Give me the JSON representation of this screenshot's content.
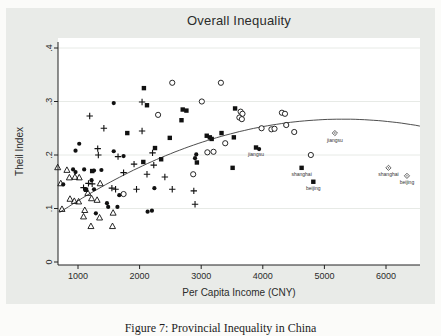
{
  "title": "Overall Inequality",
  "caption": "Figure 7: Provincial Inequality in China",
  "colors": {
    "marker": "#111111",
    "curve": "#3a3a3a",
    "figure_bg": "#e9ebe8",
    "plot_bg": "#ffffff",
    "grid": "#e7eae6",
    "axis": "#222222",
    "text": "#2b2b2b"
  },
  "axes": {
    "x": {
      "label": "Per Capita Income (CNY)",
      "ticks": [
        {
          "v": 1000,
          "label": "1000"
        },
        {
          "v": 2000,
          "label": "2000"
        },
        {
          "v": 3000,
          "label": "3000"
        },
        {
          "v": 4000,
          "label": "4000"
        },
        {
          "v": 5000,
          "label": "5000"
        },
        {
          "v": 6000,
          "label": "6000"
        }
      ]
    },
    "y": {
      "label": "Theil Index",
      "ticks": [
        {
          "v": 0,
          "label": "0"
        },
        {
          "v": 0.1,
          "label": ".1"
        },
        {
          "v": 0.2,
          "label": ".2"
        },
        {
          "v": 0.3,
          "label": ".3"
        },
        {
          "v": 0.4,
          "label": ".4"
        }
      ]
    }
  },
  "chart_data": {
    "type": "scatter",
    "title": "Overall Inequality",
    "xlabel": "Per Capita Income (CNY)",
    "ylabel": "Theil Index",
    "xlim": [
      600,
      6800
    ],
    "ylim": [
      0,
      0.42
    ],
    "grid": "horizontal-light",
    "legend": "none",
    "series": [
      {
        "name": "open-circle-markers",
        "marker": "circle-open",
        "points": [
          [
            2530,
            0.335
          ],
          [
            3320,
            0.335
          ],
          [
            2300,
            0.275
          ],
          [
            3010,
            0.3
          ],
          [
            3640,
            0.281
          ],
          [
            3670,
            0.277
          ],
          [
            3620,
            0.27
          ],
          [
            3660,
            0.267
          ],
          [
            4310,
            0.279
          ],
          [
            4360,
            0.277
          ],
          [
            4380,
            0.256
          ],
          [
            4140,
            0.248
          ],
          [
            4190,
            0.249
          ],
          [
            3980,
            0.25
          ],
          [
            4510,
            0.243
          ],
          [
            4780,
            0.2
          ],
          [
            3390,
            0.222
          ],
          [
            3100,
            0.205
          ],
          [
            3200,
            0.206
          ],
          [
            2870,
            0.164
          ],
          [
            1740,
            0.127
          ]
        ]
      },
      {
        "name": "filled-circle-markers",
        "marker": "circle-filled",
        "points": [
          [
            1580,
            0.297
          ],
          [
            1020,
            0.221
          ],
          [
            960,
            0.208
          ],
          [
            1580,
            0.207
          ],
          [
            1740,
            0.198
          ],
          [
            920,
            0.173
          ],
          [
            960,
            0.168
          ],
          [
            1100,
            0.173
          ],
          [
            1260,
            0.171
          ],
          [
            1380,
            0.172
          ],
          [
            760,
            0.145
          ],
          [
            1220,
            0.153
          ],
          [
            1260,
            0.136
          ],
          [
            1470,
            0.11
          ],
          [
            1670,
            0.125
          ],
          [
            2240,
            0.138
          ],
          [
            1490,
            0.103
          ],
          [
            1290,
            0.091
          ],
          [
            2130,
            0.094
          ],
          [
            2200,
            0.096
          ],
          [
            2920,
            0.201
          ],
          [
            2900,
            0.194
          ],
          [
            3940,
            0.211
          ],
          [
            1640,
            0.103
          ]
        ]
      },
      {
        "name": "open-triangle-markers",
        "marker": "triangle-open",
        "points": [
          [
            670,
            0.177
          ],
          [
            820,
            0.172
          ],
          [
            950,
            0.159
          ],
          [
            1020,
            0.158
          ],
          [
            860,
            0.158
          ],
          [
            720,
            0.147
          ],
          [
            1360,
            0.147
          ],
          [
            1160,
            0.129
          ],
          [
            870,
            0.118
          ],
          [
            940,
            0.114
          ],
          [
            1010,
            0.113
          ],
          [
            1220,
            0.119
          ],
          [
            1310,
            0.116
          ],
          [
            1110,
            0.097
          ],
          [
            1350,
            0.083
          ],
          [
            1570,
            0.092
          ],
          [
            1090,
            0.085
          ],
          [
            1210,
            0.067
          ],
          [
            1560,
            0.067
          ],
          [
            740,
            0.099
          ]
        ]
      },
      {
        "name": "plus-markers",
        "marker": "plus",
        "points": [
          [
            1190,
            0.273
          ],
          [
            1420,
            0.25
          ],
          [
            2040,
            0.299
          ],
          [
            2040,
            0.245
          ],
          [
            1320,
            0.212
          ],
          [
            1330,
            0.2
          ],
          [
            1650,
            0.197
          ],
          [
            2210,
            0.204
          ],
          [
            1910,
            0.183
          ],
          [
            2230,
            0.181
          ],
          [
            1740,
            0.167
          ],
          [
            2120,
            0.164
          ],
          [
            2410,
            0.159
          ],
          [
            1170,
            0.147
          ],
          [
            1230,
            0.146
          ],
          [
            1090,
            0.139
          ],
          [
            1550,
            0.138
          ],
          [
            1610,
            0.136
          ],
          [
            1950,
            0.136
          ],
          [
            2530,
            0.136
          ],
          [
            2880,
            0.133
          ],
          [
            2900,
            0.108
          ]
        ]
      },
      {
        "name": "filled-square-markers",
        "marker": "square-filled",
        "points": [
          [
            2070,
            0.325
          ],
          [
            2120,
            0.293
          ],
          [
            1800,
            0.241
          ],
          [
            2490,
            0.232
          ],
          [
            2250,
            0.213
          ],
          [
            2700,
            0.285
          ],
          [
            2760,
            0.283
          ],
          [
            2680,
            0.265
          ],
          [
            3550,
            0.287
          ],
          [
            3330,
            0.241
          ],
          [
            3140,
            0.233
          ],
          [
            3530,
            0.233
          ],
          [
            2060,
            0.187
          ],
          [
            2350,
            0.192
          ],
          [
            1130,
            0.135
          ],
          [
            3090,
            0.236
          ],
          [
            3170,
            0.23
          ],
          [
            2930,
            0.186
          ],
          [
            3510,
            0.176
          ],
          [
            1230,
            0.17
          ]
        ]
      }
    ],
    "labeled_points": [
      {
        "marker": "square-filled",
        "label": "jiangsu",
        "x": 3890,
        "y": 0.214
      },
      {
        "marker": "square-filled",
        "label": "shanghai",
        "x": 4630,
        "y": 0.176
      },
      {
        "marker": "square-filled",
        "label": "beijing",
        "x": 4820,
        "y": 0.15
      },
      {
        "marker": "diamond-open",
        "label": "jiangsu",
        "x": 5170,
        "y": 0.241
      },
      {
        "marker": "diamond-open",
        "label": "shanghai",
        "x": 6040,
        "y": 0.176
      },
      {
        "marker": "diamond-open",
        "label": "beijing",
        "x": 6340,
        "y": 0.161
      }
    ],
    "fit_curve": {
      "shape": "quadratic",
      "peak_x": 5300,
      "peak_y": 0.267,
      "coeff_a": -8.25e-09,
      "x_start": 700,
      "x_end": 6550
    }
  }
}
